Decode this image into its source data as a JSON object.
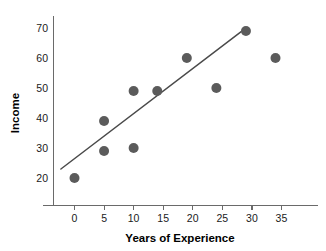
{
  "chart_data": {
    "type": "scatter",
    "title": "",
    "xlabel": "Years of Experience",
    "ylabel": "Income",
    "xlim": [
      -2.5,
      38
    ],
    "ylim": [
      15,
      74
    ],
    "grid": false,
    "legend": "none",
    "x": [
      0,
      5,
      5,
      10,
      10,
      14,
      19,
      24,
      29,
      34
    ],
    "y": [
      20,
      39,
      29,
      49,
      30,
      49,
      60,
      50,
      69,
      60
    ],
    "points": [
      {
        "x": 0,
        "y": 20
      },
      {
        "x": 5,
        "y": 39
      },
      {
        "x": 5,
        "y": 29
      },
      {
        "x": 10,
        "y": 49
      },
      {
        "x": 10,
        "y": 30
      },
      {
        "x": 14,
        "y": 49
      },
      {
        "x": 19,
        "y": 60
      },
      {
        "x": 24,
        "y": 50
      },
      {
        "x": 29,
        "y": 69
      },
      {
        "x": 34,
        "y": 60
      }
    ],
    "xticks": [
      0,
      5,
      10,
      15,
      20,
      25,
      30,
      35
    ],
    "xtick_labels": [
      "0",
      "5",
      "10",
      "15",
      "20",
      "25",
      "30",
      "35"
    ],
    "yticks": [
      20,
      30,
      40,
      50,
      60,
      70
    ],
    "ytick_labels": [
      "20",
      "30",
      "40",
      "50",
      "60",
      "70"
    ],
    "trendline": {
      "type": "line",
      "x": [
        -2.3,
        28.2
      ],
      "y": [
        23.0,
        68.8
      ]
    },
    "colors": {
      "point": "#5b5b5b",
      "trendline": "#4a4a4a",
      "axis": "#6a6a6a",
      "text": "#000000",
      "background": "#ffffff"
    },
    "marker_radius_px": 5
  },
  "axes": {
    "x_title": "Years of Experience",
    "y_title": "Income"
  },
  "labels": {
    "y": [
      "70",
      "60",
      "50",
      "40",
      "30",
      "20"
    ],
    "x": [
      "0",
      "5",
      "10",
      "15",
      "20",
      "25",
      "30",
      "35"
    ]
  }
}
